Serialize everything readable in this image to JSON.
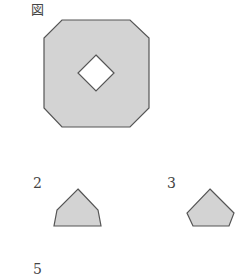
{
  "figure": {
    "label": "図",
    "main_shape": "octagon-with-square-hole",
    "fill_color": "#d3d3d3",
    "stroke_color": "#555555"
  },
  "options": [
    {
      "number": "2",
      "shape": "pentagon-house"
    },
    {
      "number": "3",
      "shape": "pentagon"
    },
    {
      "number": "5",
      "shape": ""
    }
  ]
}
